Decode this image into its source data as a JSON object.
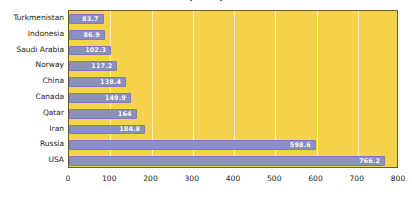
{
  "chart_data": {
    "type": "bar",
    "orientation": "horizontal",
    "title": "(2019)",
    "xlabel": "",
    "ylabel": "",
    "categories": [
      "Turkmenistan",
      "Indonesia",
      "Saudi Arabia",
      "Norway",
      "China",
      "Canada",
      "Qatar",
      "Iran",
      "Russia",
      "USA"
    ],
    "values": [
      83.7,
      86.9,
      102.3,
      117.2,
      138.4,
      149.9,
      164,
      184.8,
      598.6,
      766.2
    ],
    "value_labels": [
      "83.7",
      "86.9",
      "102.3",
      "117.2",
      "138.4",
      "149.9",
      "164",
      "184.8",
      "598.6",
      "766.2"
    ],
    "xlim": [
      0,
      800
    ],
    "xticks": [
      0,
      100,
      200,
      300,
      400,
      500,
      600,
      700,
      800
    ],
    "xtick_labels": [
      "0",
      "100",
      "200",
      "300",
      "400",
      "500",
      "600",
      "700",
      "800"
    ],
    "grid": true,
    "grid_axis": "x",
    "legend": false,
    "colors": {
      "bar": "#8b8fc4",
      "plot_background": "#f5d24b",
      "gridline": "#fdf6d8",
      "plot_border": "#6e5a1c",
      "label_text": "#ffffff",
      "axis_text": "#1a1a1a",
      "page_background": "#ffffff"
    }
  }
}
